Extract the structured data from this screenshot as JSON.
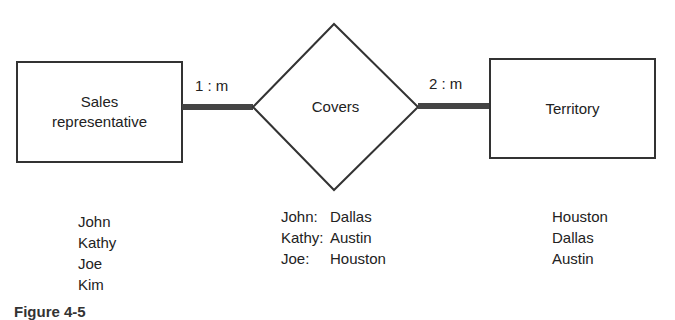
{
  "diagram": {
    "entities": [
      {
        "id": "sales_rep",
        "label_line1": "Sales",
        "label_line2": "representative"
      },
      {
        "id": "territory",
        "label": "Territory"
      }
    ],
    "relationship": {
      "label": "Covers"
    },
    "cardinalities": {
      "left": "1 : m",
      "right": "2 : m"
    },
    "colors": {
      "stroke": "#333333",
      "connector": "#444444",
      "background": "#ffffff"
    }
  },
  "instances": {
    "sales_reps": [
      "John",
      "Kathy",
      "Joe",
      "Kim"
    ],
    "covers": [
      {
        "rep": "John:",
        "territory": "Dallas"
      },
      {
        "rep": "Kathy:",
        "territory": "Austin"
      },
      {
        "rep": "Joe:",
        "territory": "Houston"
      }
    ],
    "territories": [
      "Houston",
      "Dallas",
      "Austin"
    ]
  },
  "caption": "Figure 4-5"
}
